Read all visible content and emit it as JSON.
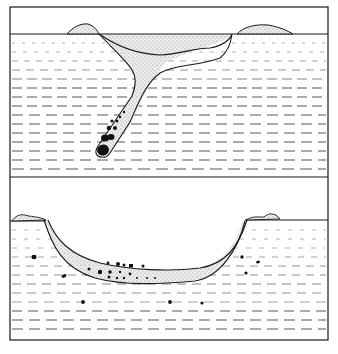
{
  "figure": {
    "colors": {
      "ink": "#1a1a1a",
      "fill_stipple": "#d9d9d9",
      "background": "#ffffff"
    },
    "panels": [
      {
        "id": "upper",
        "content": "Funnel-shaped crater with ejecta rims at surface and a tilted tube-like conduit descending lower-left, containing dark clasts near its tip"
      },
      {
        "id": "lower",
        "content": "Broad bowl-shaped depression lined with a stippled fill layer; scattered dark clasts in fill and in surrounding layered sediments"
      }
    ]
  }
}
